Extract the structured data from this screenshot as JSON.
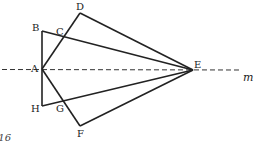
{
  "diagram": {
    "points": {
      "A": {
        "label": "A",
        "x": 42,
        "y": 69
      },
      "B": {
        "label": "B",
        "x": 42,
        "y": 31
      },
      "C": {
        "label": "C",
        "x": 63,
        "y": 38
      },
      "D": {
        "label": "D",
        "x": 80,
        "y": 13
      },
      "E": {
        "label": "E",
        "x": 193,
        "y": 70
      },
      "F": {
        "label": "F",
        "x": 80,
        "y": 126
      },
      "G": {
        "label": "G",
        "x": 63,
        "y": 101
      },
      "H": {
        "label": "H",
        "x": 42,
        "y": 106
      }
    },
    "line_label": "m",
    "caption": "316",
    "stroke_color": "#222222"
  }
}
